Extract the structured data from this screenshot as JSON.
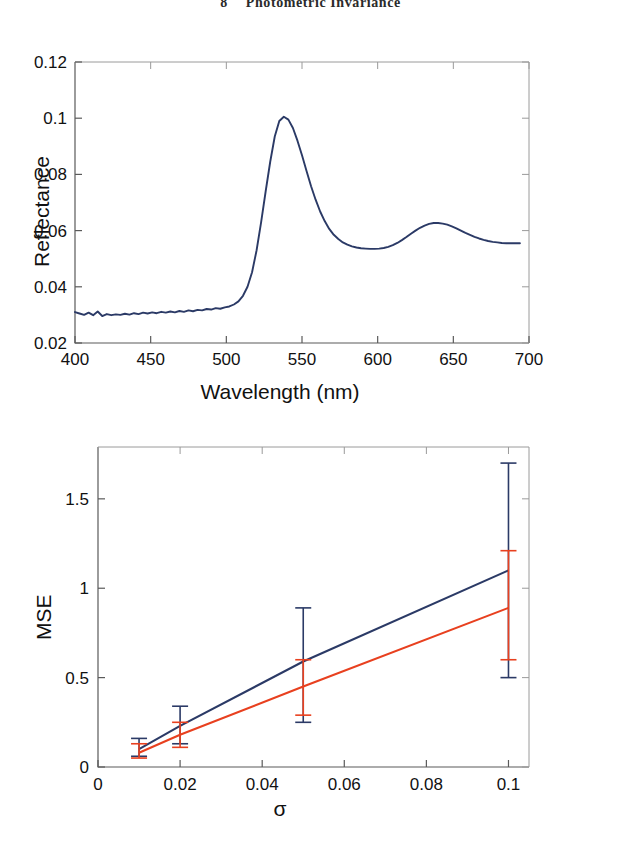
{
  "header": {
    "number": "8",
    "title": "Photometric Invariance"
  },
  "figures": [
    {
      "id": "reflectance",
      "name": "reflectance-spectrum"
    },
    {
      "id": "mse",
      "name": "mse-vs-sigma"
    }
  ],
  "chart_data": [
    {
      "type": "line",
      "name": "reflectance-spectrum",
      "title": "",
      "xlabel": "Wavelength (nm)",
      "ylabel": "Reflectance",
      "xlim": [
        400,
        700
      ],
      "ylim": [
        0.02,
        0.12
      ],
      "xticks": [
        400,
        450,
        500,
        550,
        600,
        650,
        700
      ],
      "xticklabels": [
        "400",
        "450",
        "500",
        "550",
        "600",
        "650",
        "700"
      ],
      "yticks": [
        0.02,
        0.04,
        0.06,
        0.08,
        0.1,
        0.12
      ],
      "yticklabels": [
        "0.02",
        "0.04",
        "0.06",
        "0.08",
        "0.1",
        "0.12"
      ],
      "grid": false,
      "legend": "none",
      "series": [
        {
          "name": "reflectance",
          "color": "#2b3a66",
          "x": [
            400,
            403,
            406,
            409,
            412,
            415,
            418,
            421,
            424,
            427,
            430,
            433,
            436,
            439,
            442,
            445,
            448,
            451,
            454,
            457,
            460,
            463,
            466,
            469,
            472,
            475,
            478,
            481,
            484,
            487,
            490,
            493,
            496,
            499,
            502,
            505,
            508,
            511,
            514,
            517,
            520,
            523,
            526,
            529,
            532,
            535,
            538,
            541,
            544,
            547,
            550,
            553,
            556,
            559,
            562,
            565,
            568,
            571,
            574,
            577,
            580,
            583,
            586,
            589,
            592,
            595,
            598,
            601,
            604,
            607,
            610,
            613,
            616,
            619,
            622,
            625,
            628,
            631,
            634,
            637,
            640,
            643,
            646,
            649,
            652,
            655,
            658,
            661,
            664,
            667,
            670,
            673,
            676,
            679,
            682,
            685,
            688,
            691,
            694,
            697,
            700
          ],
          "y": [
            0.031,
            0.0305,
            0.03,
            0.0308,
            0.0299,
            0.0312,
            0.0296,
            0.0303,
            0.0299,
            0.0302,
            0.03,
            0.0304,
            0.0301,
            0.0306,
            0.0303,
            0.0308,
            0.0305,
            0.0309,
            0.0306,
            0.0311,
            0.0308,
            0.0312,
            0.0309,
            0.0314,
            0.0311,
            0.0316,
            0.0313,
            0.0318,
            0.0316,
            0.0321,
            0.0319,
            0.0324,
            0.0322,
            0.0327,
            0.033,
            0.0337,
            0.0348,
            0.0368,
            0.04,
            0.0452,
            0.053,
            0.063,
            0.074,
            0.0845,
            0.0935,
            0.099,
            0.1005,
            0.0995,
            0.0965,
            0.092,
            0.0868,
            0.0812,
            0.0758,
            0.071,
            0.0668,
            0.0634,
            0.0606,
            0.0585,
            0.057,
            0.0558,
            0.055,
            0.0544,
            0.054,
            0.0537,
            0.0536,
            0.0535,
            0.0535,
            0.0536,
            0.0538,
            0.0542,
            0.0548,
            0.0556,
            0.0566,
            0.0577,
            0.0589,
            0.06,
            0.061,
            0.0618,
            0.0624,
            0.0627,
            0.0627,
            0.0625,
            0.0621,
            0.0615,
            0.0608,
            0.06,
            0.0592,
            0.0585,
            0.0578,
            0.0572,
            0.0567,
            0.0563,
            0.056,
            0.0558,
            0.0556,
            0.0555,
            0.0555,
            0.0555,
            0.0555
          ]
        }
      ]
    },
    {
      "type": "line",
      "name": "mse-vs-sigma",
      "title": "",
      "xlabel": "σ",
      "ylabel": "MSE",
      "xlim": [
        0,
        0.105
      ],
      "ylim": [
        0,
        1.79
      ],
      "xticks": [
        0,
        0.02,
        0.04,
        0.06,
        0.08,
        0.1
      ],
      "xticklabels": [
        "0",
        "0.02",
        "0.04",
        "0.06",
        "0.08",
        "0.1"
      ],
      "yticks": [
        0,
        0.5,
        1,
        1.5
      ],
      "yticklabels": [
        "0",
        "0.5",
        "1",
        "1.5"
      ],
      "grid": false,
      "legend": "none",
      "x": [
        0.01,
        0.02,
        0.05,
        0.1
      ],
      "series": [
        {
          "name": "series-navy",
          "color": "#2b3a66",
          "values": [
            0.1,
            0.23,
            0.59,
            1.1
          ],
          "err_low": [
            0.04,
            0.1,
            0.34,
            0.6
          ],
          "err_high": [
            0.06,
            0.11,
            0.3,
            0.6
          ],
          "yerr_lower_abs": [
            0.06,
            0.13,
            0.25,
            0.5
          ],
          "yerr_upper_abs": [
            0.16,
            0.34,
            0.89,
            1.7
          ]
        },
        {
          "name": "series-red",
          "color": "#e8401f",
          "values": [
            0.08,
            0.18,
            0.45,
            0.89
          ],
          "err_low": [
            0.03,
            0.07,
            0.16,
            0.29
          ],
          "err_high": [
            0.05,
            0.07,
            0.15,
            0.32
          ],
          "yerr_lower_abs": [
            0.05,
            0.11,
            0.29,
            0.6
          ],
          "yerr_upper_abs": [
            0.13,
            0.25,
            0.6,
            1.21
          ]
        }
      ]
    }
  ]
}
